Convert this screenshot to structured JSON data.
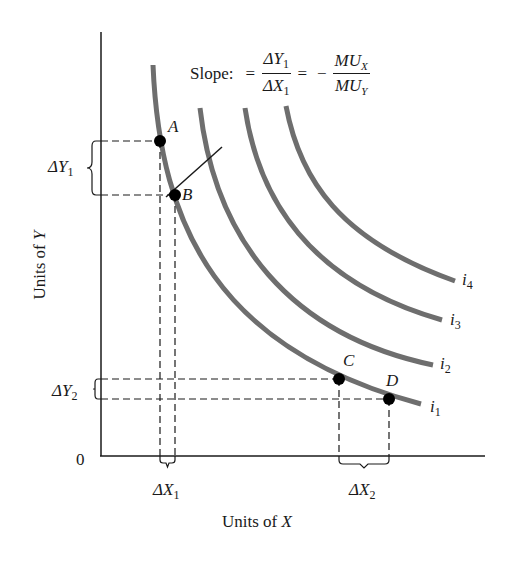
{
  "chart_data": {
    "type": "line",
    "title": "",
    "xlabel": "Units of X",
    "ylabel": "Units of Y",
    "origin_label": "0",
    "grid": false,
    "legend": "inline labels at curve ends",
    "slope_annotation": {
      "prefix": "Slope:",
      "equals": "=",
      "numerator": "ΔY",
      "numerator_sub": "1",
      "denominator": "ΔX",
      "denominator_sub": "1",
      "rhs_sign": "−",
      "rhs_numerator": "MU",
      "rhs_numerator_sub": "X",
      "rhs_denominator": "MU",
      "rhs_denominator_sub": "Y"
    },
    "series": [
      {
        "name": "i1",
        "label": "i",
        "sub": "1",
        "description": "indifference curve 1 (lowest)"
      },
      {
        "name": "i2",
        "label": "i",
        "sub": "2",
        "description": "indifference curve 2"
      },
      {
        "name": "i3",
        "label": "i",
        "sub": "3",
        "description": "indifference curve 3"
      },
      {
        "name": "i4",
        "label": "i",
        "sub": "4",
        "description": "indifference curve 4 (highest)"
      }
    ],
    "points": [
      {
        "label": "A",
        "curve": "i1"
      },
      {
        "label": "B",
        "curve": "i1"
      },
      {
        "label": "C",
        "curve": "i1"
      },
      {
        "label": "D",
        "curve": "i1"
      }
    ],
    "brackets": [
      {
        "label": "ΔY",
        "sub": "1",
        "between": [
          "A",
          "B"
        ],
        "axis": "y"
      },
      {
        "label": "ΔY",
        "sub": "2",
        "between": [
          "C",
          "D"
        ],
        "axis": "y"
      },
      {
        "label": "ΔX",
        "sub": "1",
        "between": [
          "A",
          "B"
        ],
        "axis": "x"
      },
      {
        "label": "ΔX",
        "sub": "2",
        "between": [
          "C",
          "D"
        ],
        "axis": "x"
      }
    ],
    "colors": {
      "curve": "#6e6e6e",
      "axis": "#1a1a1a",
      "point": "#000000",
      "guide": "#1a1a1a"
    }
  }
}
